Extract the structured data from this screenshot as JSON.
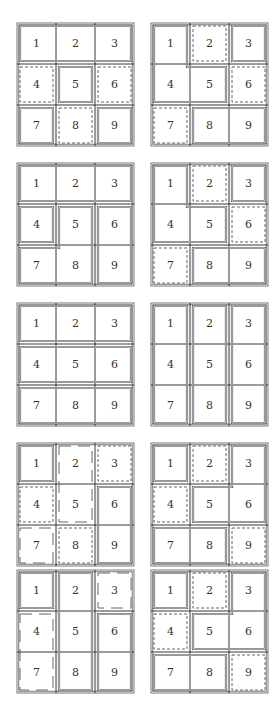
{
  "figure": {
    "cell_labels": [
      "1",
      "2",
      "3",
      "4",
      "5",
      "6",
      "7",
      "8",
      "9"
    ],
    "line_color": "#555555",
    "panels": [
      {
        "id": "r1-left",
        "regions": [
          {
            "cells": [
              1,
              2,
              3
            ],
            "style": "solid"
          },
          {
            "cells": [
              4
            ],
            "style": "dashed"
          },
          {
            "cells": [
              5
            ],
            "style": "solid"
          },
          {
            "cells": [
              6
            ],
            "style": "dashed"
          },
          {
            "cells": [
              7
            ],
            "style": "solid"
          },
          {
            "cells": [
              8
            ],
            "style": "dashed"
          },
          {
            "cells": [
              9
            ],
            "style": "solid"
          }
        ]
      },
      {
        "id": "r1-right",
        "regions": [
          {
            "cells": [
              1,
              4,
              5
            ],
            "style": "solid"
          },
          {
            "cells": [
              2
            ],
            "style": "dashed"
          },
          {
            "cells": [
              3
            ],
            "style": "solid"
          },
          {
            "cells": [
              6
            ],
            "style": "dashed"
          },
          {
            "cells": [
              7
            ],
            "style": "dashed"
          },
          {
            "cells": [
              8,
              9
            ],
            "style": "solid"
          }
        ]
      },
      {
        "id": "r2-left",
        "regions": [
          {
            "cells": [
              1,
              2,
              3
            ],
            "style": "solid"
          },
          {
            "cells": [
              4
            ],
            "style": "solid"
          },
          {
            "cells": [
              5,
              7,
              8
            ],
            "style": "solid"
          },
          {
            "cells": [
              6,
              9
            ],
            "style": "solid"
          }
        ]
      },
      {
        "id": "r2-right",
        "regions": [
          {
            "cells": [
              1,
              4,
              5
            ],
            "style": "solid"
          },
          {
            "cells": [
              2
            ],
            "style": "dashed"
          },
          {
            "cells": [
              3
            ],
            "style": "solid"
          },
          {
            "cells": [
              6
            ],
            "style": "dashed"
          },
          {
            "cells": [
              7
            ],
            "style": "dashed"
          },
          {
            "cells": [
              8,
              9
            ],
            "style": "solid"
          }
        ]
      },
      {
        "id": "r3-left",
        "regions": [
          {
            "cells": [
              1,
              2,
              3
            ],
            "style": "solid"
          },
          {
            "cells": [
              4,
              5,
              6
            ],
            "style": "solid"
          },
          {
            "cells": [
              7,
              8,
              9
            ],
            "style": "solid"
          }
        ]
      },
      {
        "id": "r3-right",
        "regions": [
          {
            "cells": [
              1,
              4,
              7
            ],
            "style": "solid"
          },
          {
            "cells": [
              2,
              5,
              8
            ],
            "style": "solid"
          },
          {
            "cells": [
              3,
              6,
              9
            ],
            "style": "solid"
          }
        ]
      },
      {
        "id": "r4-left",
        "regions": [
          {
            "cells": [
              1
            ],
            "style": "solid"
          },
          {
            "cells": [
              2,
              5
            ],
            "style": "longdash"
          },
          {
            "cells": [
              3
            ],
            "style": "dashed"
          },
          {
            "cells": [
              4
            ],
            "style": "dashed"
          },
          {
            "cells": [
              6,
              9
            ],
            "style": "solid"
          },
          {
            "cells": [
              7
            ],
            "style": "longdash"
          },
          {
            "cells": [
              8
            ],
            "style": "dashed"
          }
        ]
      },
      {
        "id": "r4-right",
        "regions": [
          {
            "cells": [
              1
            ],
            "style": "solid"
          },
          {
            "cells": [
              2
            ],
            "style": "dashed"
          },
          {
            "cells": [
              3,
              5,
              6
            ],
            "style": "solid"
          },
          {
            "cells": [
              4
            ],
            "style": "dashed"
          },
          {
            "cells": [
              7,
              8
            ],
            "style": "solid"
          },
          {
            "cells": [
              9
            ],
            "style": "dashed"
          }
        ]
      },
      {
        "id": "r5-left",
        "regions": [
          {
            "cells": [
              1
            ],
            "style": "solid"
          },
          {
            "cells": [
              2,
              5,
              8
            ],
            "style": "solid"
          },
          {
            "cells": [
              3
            ],
            "style": "longdash"
          },
          {
            "cells": [
              4,
              7
            ],
            "style": "longdash"
          },
          {
            "cells": [
              6,
              9
            ],
            "style": "solid"
          }
        ]
      },
      {
        "id": "r5-right",
        "regions": [
          {
            "cells": [
              1
            ],
            "style": "solid"
          },
          {
            "cells": [
              2
            ],
            "style": "dashed"
          },
          {
            "cells": [
              3,
              5,
              6
            ],
            "style": "solid"
          },
          {
            "cells": [
              4
            ],
            "style": "dashed"
          },
          {
            "cells": [
              7,
              8
            ],
            "style": "solid"
          },
          {
            "cells": [
              9
            ],
            "style": "dashed"
          }
        ]
      }
    ]
  }
}
